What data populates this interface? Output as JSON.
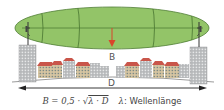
{
  "diagram": {
    "labels": {
      "b": "B",
      "d": "D"
    },
    "formula": {
      "lhs": "B = 0,5 · √",
      "radicand": "λ · D",
      "legend_symbol": "λ",
      "legend_text": ": Wellenlänge"
    },
    "colors": {
      "zone_fill": "#93c468",
      "zone_stroke": "#4f7d35",
      "arrow_red": "#d9452b",
      "roof_red": "#c9564a",
      "building_gray": "#a9acae",
      "building_beige": "#d9c9a8",
      "tower_gray": "#b7b9bb",
      "line_dark": "#222222"
    },
    "elements": {
      "left_tower": "Sendemast links",
      "right_tower": "Sendemast rechts",
      "fresnel_zone": "Fresnel-Ellipse",
      "distance_arrow": "Abstand D",
      "clearance_arrow": "Radius B"
    }
  }
}
